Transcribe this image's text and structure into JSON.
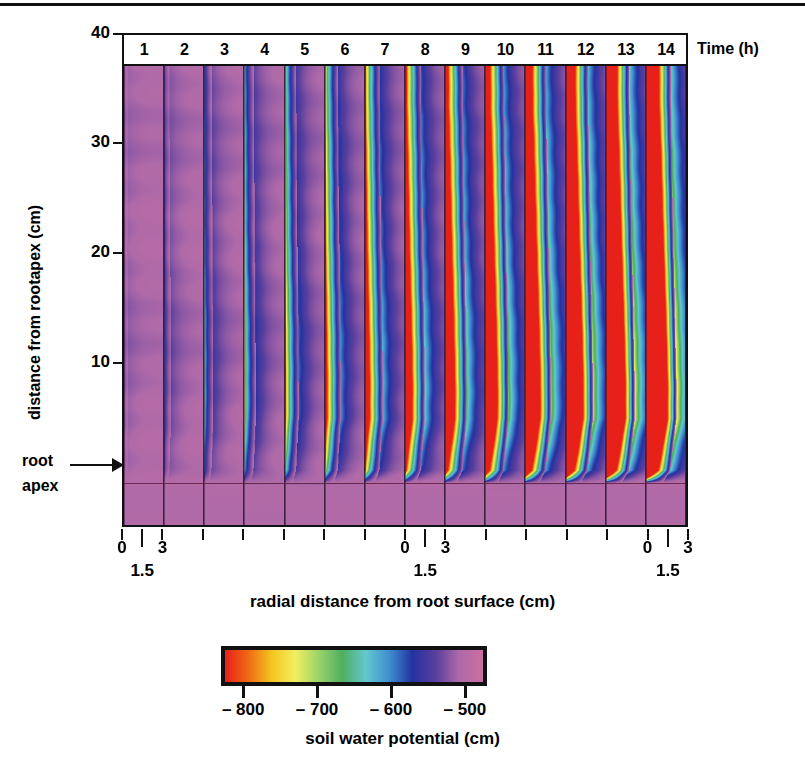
{
  "figure": {
    "type": "heatmap-panel-series",
    "top_rule": "horizontal-rule"
  },
  "chart_data": {
    "type": "heatmap",
    "title": "",
    "xlabel": "radial distance from root surface (cm)",
    "ylabel": "distance from rootapex  (cm)",
    "panel_axis_label": "Time (h)",
    "panels": [
      {
        "label": "1",
        "time_h": 1
      },
      {
        "label": "2",
        "time_h": 2
      },
      {
        "label": "3",
        "time_h": 3
      },
      {
        "label": "4",
        "time_h": 4
      },
      {
        "label": "5",
        "time_h": 5
      },
      {
        "label": "6",
        "time_h": 6
      },
      {
        "label": "7",
        "time_h": 7
      },
      {
        "label": "8",
        "time_h": 8
      },
      {
        "label": "9",
        "time_h": 9
      },
      {
        "label": "10",
        "time_h": 10
      },
      {
        "label": "11",
        "time_h": 11
      },
      {
        "label": "12",
        "time_h": 12
      },
      {
        "label": "13",
        "time_h": 13
      },
      {
        "label": "14",
        "time_h": 14
      }
    ],
    "yticks": [
      40,
      30,
      20,
      10
    ],
    "ylim": [
      -4,
      40
    ],
    "xticks_per_panel": [
      "0",
      "1.5",
      "3"
    ],
    "xlim_per_panel": [
      0,
      3
    ],
    "xtick_label_groups": [
      {
        "panel_index": 0,
        "labels": [
          "0",
          "1.5",
          "3"
        ]
      },
      {
        "panel_index": 7,
        "labels": [
          "0",
          "1.5",
          "3"
        ]
      },
      {
        "panel_index": 13,
        "labels": [
          "0",
          "1.5",
          "3"
        ]
      }
    ],
    "annotations": [
      {
        "name": "root-apex",
        "text_line1": "root",
        "text_line2": "apex",
        "y_value": 0,
        "arrow": "right"
      }
    ],
    "colorbar": {
      "label": "soil water potential   (cm)",
      "ticks": [
        "– 800",
        "– 700",
        "– 600",
        "– 500"
      ],
      "tick_values": [
        -800,
        -700,
        -600,
        -500
      ],
      "vmin": -830,
      "vmax": -470,
      "orientation": "horizontal",
      "colors": [
        "#e8201a",
        "#f06a14",
        "#f5c61e",
        "#f2ee60",
        "#9ad36a",
        "#4fae5e",
        "#63c8cd",
        "#3f8fd0",
        "#2432a0",
        "#5a3f9e",
        "#b06aa8",
        "#c96fa0"
      ]
    },
    "series_description": {
      "background_potential_cm": -500,
      "depletion_zone_min_cm": -830,
      "note": "water depletion zone widens with time adjacent to the root surface"
    }
  },
  "colors": {
    "axis": "#111111",
    "background": "#ffffff",
    "panel_divider": "#3a2440",
    "apex_line": "#5a2040"
  }
}
